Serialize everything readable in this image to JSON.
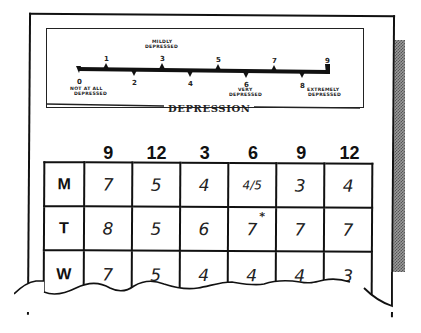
{
  "scale": {
    "title": "DEPRESSION",
    "ticks_above": [
      "1",
      "3",
      "5",
      "7",
      "9"
    ],
    "ticks_below": [
      "0",
      "2",
      "4",
      "6",
      "8"
    ],
    "anchors": {
      "zero": [
        "NOT AT ALL",
        "DEPRESSED"
      ],
      "three": [
        "MILDLY",
        "DEPRESSED"
      ],
      "six": [
        "VERY",
        "DEPRESSED"
      ],
      "nine": [
        "EXTREMELY",
        "DEPRESSED"
      ]
    }
  },
  "table": {
    "times": [
      "9",
      "12",
      "3",
      "6",
      "9",
      "12"
    ],
    "rows": [
      {
        "day": "M",
        "values": [
          "7",
          "5",
          "4",
          "4/5",
          "3",
          "4"
        ]
      },
      {
        "day": "T",
        "values": [
          "8",
          "5",
          "6",
          "7",
          "7",
          "7"
        ]
      },
      {
        "day": "W",
        "values": [
          "7",
          "5",
          "4",
          "4",
          "4",
          "3"
        ]
      }
    ],
    "annotation": "*"
  }
}
